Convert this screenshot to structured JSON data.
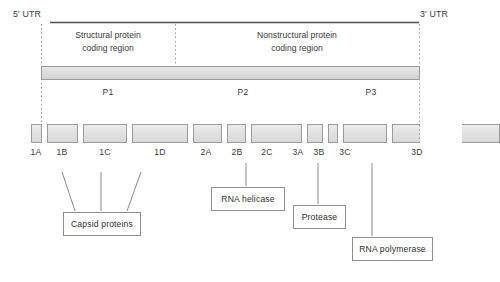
{
  "figure": {
    "utr_left": "5' UTR",
    "utr_right": "3' UTR",
    "regions": [
      {
        "id": "structural",
        "line1": "Structural protein",
        "line2": "coding region"
      },
      {
        "id": "nonstructural",
        "line1": "Nonstructural protein",
        "line2": "coding region"
      }
    ],
    "precursors": [
      {
        "label": "P1"
      },
      {
        "label": "P2"
      },
      {
        "label": "P3"
      }
    ],
    "genes": [
      {
        "label": "1A"
      },
      {
        "label": "1B"
      },
      {
        "label": "1C"
      },
      {
        "label": "1D"
      },
      {
        "label": "2A"
      },
      {
        "label": "2B"
      },
      {
        "label": "2C"
      },
      {
        "label": "3A"
      },
      {
        "label": "3B"
      },
      {
        "label": "3C"
      },
      {
        "label": "3D"
      }
    ],
    "callouts": [
      {
        "id": "capsid",
        "label": "Capsid proteins"
      },
      {
        "id": "rna-helicase",
        "label": "RNA helicase"
      },
      {
        "id": "protease",
        "label": "Protease"
      },
      {
        "id": "rna-polymerase",
        "label": "RNA polymerase"
      }
    ],
    "colors": {
      "line": "#555555",
      "box_fill": "#e4e4e4",
      "box_stroke": "#9b9b9b",
      "text": "#3a3a3a",
      "background": "#ffffff"
    }
  }
}
